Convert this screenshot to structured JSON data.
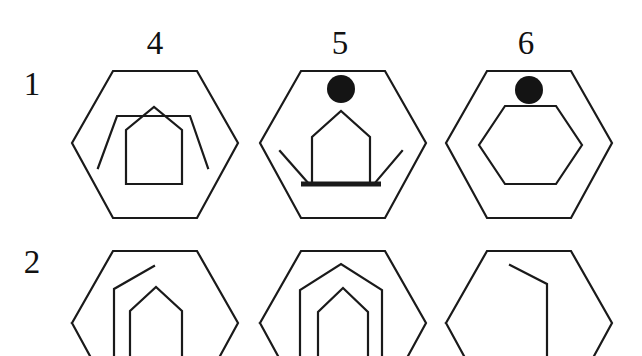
{
  "figure": {
    "type": "progressive-matrix",
    "background_color": "#ffffff",
    "stroke_color": "#1a1a1a",
    "fill_color": "#141414",
    "column_headers": [
      "4",
      "5",
      "6"
    ],
    "row_headers": [
      "1",
      "2"
    ],
    "cells": [
      {
        "id": "cell-1-4",
        "row": "1",
        "column": "4",
        "description": "hexagon containing an inverted-V wing band and a house/pentagon outline"
      },
      {
        "id": "cell-1-5",
        "row": "1",
        "column": "5",
        "description": "hexagon containing a black circle, a house/pentagon outline with thick base line, and two splayed wing lines"
      },
      {
        "id": "cell-1-6",
        "row": "1",
        "column": "6",
        "description": "hexagon containing a black circle and a smaller inner hexagon"
      },
      {
        "id": "cell-2-4",
        "row": "2",
        "column": "4",
        "description": "hexagon containing a bent line and a house/pentagon outline, cropped at the bottom"
      },
      {
        "id": "cell-2-5",
        "row": "2",
        "column": "5",
        "description": "hexagon containing two nested house/pentagon outlines, cropped at the bottom"
      },
      {
        "id": "cell-2-6",
        "row": "2",
        "column": "6",
        "description": "hexagon containing a single bent line, cropped at the bottom"
      }
    ]
  }
}
